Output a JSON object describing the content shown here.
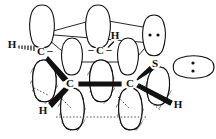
{
  "figure": {
    "type": "chemistry-orbital-diagram"
  },
  "atoms": [
    {
      "id": "c1",
      "label": "C",
      "charge": "–",
      "x": 41,
      "y": 52
    },
    {
      "id": "c2",
      "label": "C",
      "charge": "–",
      "x": 100,
      "y": 51
    },
    {
      "id": "s1",
      "label": "S",
      "charge": "",
      "x": 155,
      "y": 64
    },
    {
      "id": "c3",
      "label": "C",
      "charge": "",
      "x": 70,
      "y": 84
    },
    {
      "id": "c4",
      "label": "C",
      "charge": "",
      "x": 130,
      "y": 84
    }
  ],
  "hydrogens": [
    {
      "id": "h-left",
      "label": "H",
      "x": 12,
      "y": 45,
      "bond": "hashed"
    },
    {
      "id": "h-top-middle",
      "label": "H",
      "x": 115,
      "y": 36,
      "bond": "hashed"
    },
    {
      "id": "h-bottom-left",
      "label": "H",
      "x": 43,
      "y": 111,
      "bond": "wedge"
    },
    {
      "id": "h-bottom-right",
      "label": "H",
      "x": 178,
      "y": 105,
      "bond": "wedge"
    }
  ],
  "charges": {
    "c1_charge": "–",
    "c2_left_charge": "–",
    "c2_right_charge": "–"
  },
  "lone_pairs": [
    {
      "id": "lp-s-upper",
      "orientation": "horizontal",
      "x": 154,
      "y": 35,
      "count": 2
    },
    {
      "id": "lp-s-right",
      "orientation": "vertical",
      "x": 193,
      "y": 67,
      "count": 2
    }
  ],
  "orbitals": {
    "upper_open": [
      {
        "id": "orb-up-1",
        "cx": 42,
        "cy": 27,
        "rx": 14,
        "ry": 22,
        "angle": 0
      },
      {
        "id": "orb-up-2",
        "cx": 98,
        "cy": 27,
        "rx": 14,
        "ry": 22,
        "angle": 0
      },
      {
        "id": "orb-up-3",
        "cx": 154,
        "cy": 34,
        "rx": 13,
        "ry": 20,
        "angle": 0
      },
      {
        "id": "orb-mid-open-1",
        "cx": 72,
        "cy": 56,
        "rx": 13,
        "ry": 20,
        "angle": 0
      },
      {
        "id": "orb-mid-open-2",
        "cx": 128,
        "cy": 56,
        "rx": 13,
        "ry": 20,
        "angle": 0
      },
      {
        "id": "orb-s-lobe-right",
        "cx": 193,
        "cy": 67,
        "rx": 22,
        "ry": 13,
        "angle": 0
      }
    ],
    "lower_hatched": [
      {
        "id": "orb-lo-1",
        "cx": 44,
        "cy": 82,
        "rx": 14,
        "ry": 22,
        "angle": -8
      },
      {
        "id": "orb-lo-2",
        "cx": 101,
        "cy": 82,
        "rx": 14,
        "ry": 22,
        "angle": -8
      },
      {
        "id": "orb-lo-3",
        "cx": 158,
        "cy": 88,
        "rx": 13,
        "ry": 21,
        "angle": -14
      },
      {
        "id": "orb-lo-4",
        "cx": 72,
        "cy": 110,
        "rx": 14,
        "ry": 22,
        "angle": -8
      },
      {
        "id": "orb-lo-5",
        "cx": 130,
        "cy": 110,
        "rx": 14,
        "ry": 22,
        "angle": -8
      }
    ]
  },
  "bonds": [
    {
      "id": "bond-c3-c4",
      "from": "c3",
      "to": "c4",
      "style": "bold"
    },
    {
      "id": "bond-c1-c3",
      "from": "c1",
      "to": "c3",
      "style": "wedge"
    },
    {
      "id": "bond-c4-s1",
      "from": "c4",
      "to": "s1",
      "style": "wedge"
    },
    {
      "id": "bond-c1-c2",
      "from": "c1",
      "to": "c2",
      "style": "plain"
    },
    {
      "id": "bond-c2-s1",
      "from": "c2",
      "to": "s1",
      "style": "plain"
    },
    {
      "id": "bond-lobe-dotted",
      "from": "orb-lo-4",
      "to": "orb-lo-5",
      "style": "dotted"
    }
  ],
  "colors": {
    "ink": "#111111",
    "paper": "#ffffff",
    "dotted": "#555555"
  }
}
